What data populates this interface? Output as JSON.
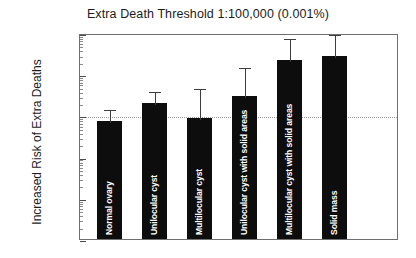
{
  "chart_data": {
    "type": "bar",
    "title": "Extra Death Threshold 1:100,000 (0.001%)",
    "xlabel": "",
    "ylabel": "Increased Risk of Extra Deaths",
    "yscale": "log",
    "ylim": [
      0.1,
      10000
    ],
    "ytick_labels": [
      "10000",
      "1000",
      "100",
      "10",
      "1",
      "0.1"
    ],
    "ytick_values": [
      10000,
      1000,
      100,
      10,
      1,
      0.1
    ],
    "grid": false,
    "legend": "none",
    "annotations": [
      {
        "name": "threshold-line",
        "value": 100,
        "style": "dotted",
        "label": ""
      }
    ],
    "categories": [
      "Normal ovary",
      "Unilocular cyst",
      "Multilocular cyst",
      "Unilocular cyst with solid areas",
      "Multilocular cyst with solid areas",
      "Solid mass"
    ],
    "values": [
      75,
      200,
      85,
      300,
      2200,
      2800
    ],
    "error_upper": [
      150,
      420,
      480,
      1600,
      8000,
      11000
    ]
  }
}
